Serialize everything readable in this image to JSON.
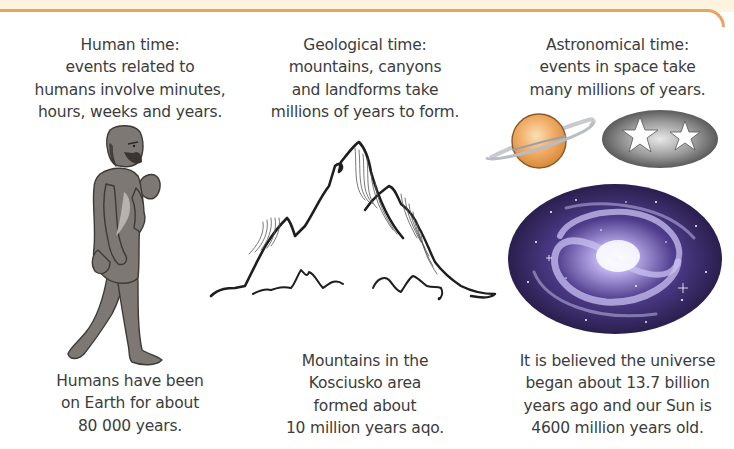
{
  "decor": {
    "band_color": "#fdf3de",
    "rule_color": "#e8a65c"
  },
  "columns": [
    {
      "id": "human",
      "heading_lines": [
        "Human time:",
        "events related to",
        "humans involve minutes,",
        "hours, weeks and years."
      ],
      "illustration": "walking-early-human-icon",
      "caption_lines": [
        "Humans have been",
        "on Earth for about",
        "80 000 years."
      ]
    },
    {
      "id": "geological",
      "heading_lines": [
        "Geological time:",
        "mountains, canyons",
        "and landforms take",
        "millions of years to form."
      ],
      "illustration": "mountains-icon",
      "caption_lines": [
        "Mountains in the",
        "Kosciusko area",
        "formed about",
        "10 million years aqo."
      ]
    },
    {
      "id": "astronomical",
      "heading_lines": [
        "Astronomical time:",
        "events in space take",
        "many millions of years."
      ],
      "illustrations": [
        "saturn-planet-icon",
        "stars-oval-icon",
        "spiral-galaxy-icon"
      ],
      "caption_lines": [
        "It is believed the universe",
        "began about 13.7 billion",
        "years ago and our Sun is",
        "4600 million years old."
      ]
    }
  ],
  "colors": {
    "text": "#3c3c3c",
    "human_skin": "#7b7570",
    "planet": "#f0a860",
    "galaxy_dark": "#2b1f55",
    "galaxy_light": "#c9c2f0"
  }
}
